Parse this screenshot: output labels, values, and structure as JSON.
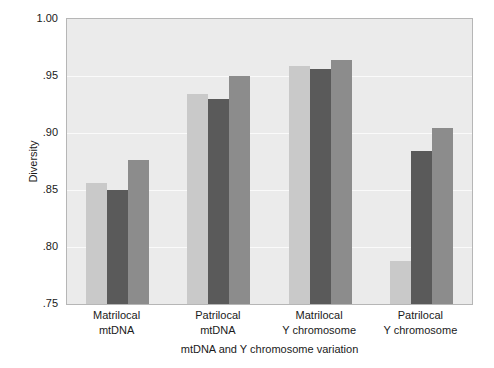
{
  "chart_data": {
    "type": "bar",
    "title": "",
    "xlabel": "mtDNA and Y chromosome variation",
    "ylabel": "Diversity",
    "ylim": [
      0.75,
      1.0
    ],
    "yticks": [
      "1.00",
      ".95",
      ".90",
      ".85",
      ".80",
      ".75"
    ],
    "ytick_values": [
      1.0,
      0.95,
      0.9,
      0.85,
      0.8,
      0.75
    ],
    "grid": true,
    "legend": "none",
    "categories": [
      "Matrilocal\nmtDNA",
      "Patrilocal\nmtDNA",
      "Matrilocal\nY chromosome",
      "Patrilocal\nY chromosome"
    ],
    "category_lines": [
      {
        "line1": "Matrilocal",
        "line2": "mtDNA"
      },
      {
        "line1": "Patrilocal",
        "line2": "mtDNA"
      },
      {
        "line1": "Matrilocal",
        "line2": "Y chromosome"
      },
      {
        "line1": "Patrilocal",
        "line2": "Y chromosome"
      }
    ],
    "series": [
      {
        "name": "series-1",
        "color": "#c9c9c9",
        "values": [
          0.856,
          0.934,
          0.959,
          0.788
        ]
      },
      {
        "name": "series-2",
        "color": "#5a5a5a",
        "values": [
          0.85,
          0.93,
          0.956,
          0.884
        ]
      },
      {
        "name": "series-3",
        "color": "#8c8c8c",
        "values": [
          0.876,
          0.95,
          0.964,
          0.904
        ]
      }
    ],
    "colors": {
      "plot_background": "#ebebeb",
      "plot_border": "#b6b6b6",
      "gridline": "#fafafa",
      "series_1": "#c9c9c9",
      "series_2": "#5a5a5a",
      "series_3": "#8c8c8c",
      "text": "#1a1a1a"
    }
  }
}
